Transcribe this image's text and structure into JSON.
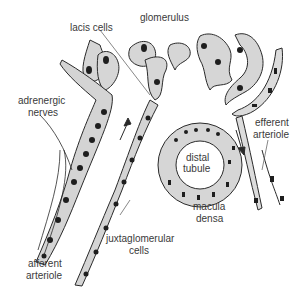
{
  "diagram": {
    "labels": {
      "lacis_cells": "lacis cells",
      "glomerulus": "glomerulus",
      "adrenergic_nerves_1": "adrenergic",
      "adrenergic_nerves_2": "nerves",
      "distal_tubule_1": "distal",
      "distal_tubule_2": "tubule",
      "efferent_arteriole_1": "efferent",
      "efferent_arteriole_2": "arteriole",
      "macula_densa_1": "macula",
      "macula_densa_2": "densa",
      "juxtaglomerular_cells_1": "juxtaglomerular",
      "juxtaglomerular_cells_2": "cells",
      "afferent_arteriole_1": "afferent",
      "afferent_arteriole_2": "arteriole"
    },
    "colors": {
      "cell_fill": "#d4d4d4",
      "nucleus": "#1e1e1e",
      "outline": "#2a2a2a",
      "text": "#3a3a3a"
    }
  }
}
